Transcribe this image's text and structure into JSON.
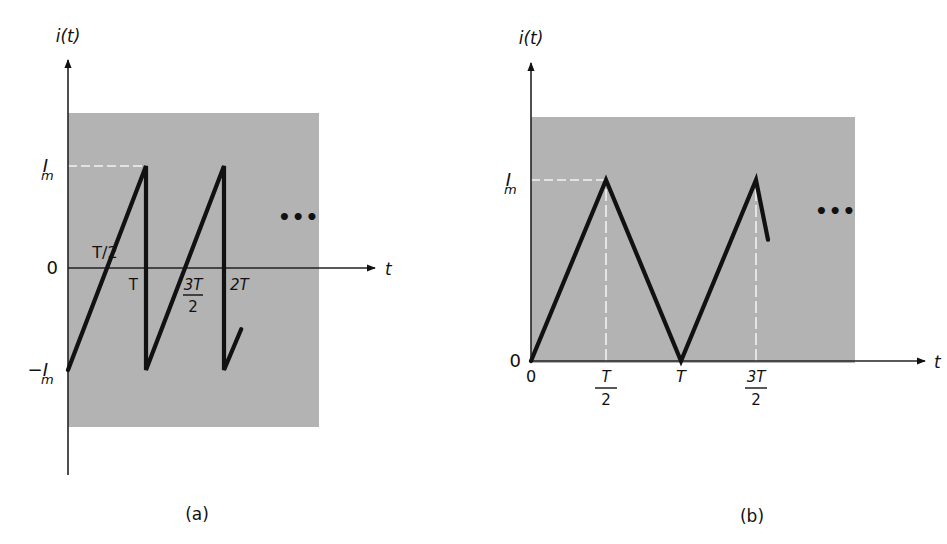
{
  "colors": {
    "background": "#ffffff",
    "panel_fill": "#b3b3b3",
    "waveform": "#111111",
    "axis": "#222222",
    "guide": "#f2f2f2"
  },
  "chart_data": [
    {
      "type": "line",
      "panel_label": "(a)",
      "title": "Sawtooth current waveform",
      "ylabel": "i(t)",
      "xlabel": "t",
      "y_ticks": [
        {
          "label": "I",
          "sub": "m",
          "value": 1
        },
        {
          "label": "0",
          "sub": "",
          "value": 0
        },
        {
          "label": "−I",
          "sub": "m",
          "value": -1
        }
      ],
      "x_ticks": [
        {
          "label": "T/2",
          "value": 0.5,
          "fraction": false
        },
        {
          "label": "T",
          "value": 1.0,
          "fraction": false
        },
        {
          "num": "3T",
          "den": "2",
          "value": 1.5,
          "fraction": true
        },
        {
          "label": "2T",
          "value": 2.0,
          "fraction": false
        }
      ],
      "xlim": [
        0,
        3.0
      ],
      "ylim": [
        -1.6,
        1.5
      ],
      "points": [
        [
          0,
          -1
        ],
        [
          1,
          1
        ],
        [
          1,
          -1
        ],
        [
          2,
          1
        ],
        [
          2,
          -1
        ],
        [
          2.22,
          -0.6
        ]
      ],
      "guides": [
        {
          "kind": "horizontal",
          "from": [
            0,
            1
          ],
          "to": [
            1,
            1
          ]
        }
      ],
      "continuation": "•••"
    },
    {
      "type": "line",
      "panel_label": "(b)",
      "title": "Triangular current waveform",
      "ylabel": "i(t)",
      "xlabel": "t",
      "y_ticks": [
        {
          "label": "I",
          "sub": "m",
          "value": 1
        },
        {
          "label": "0",
          "sub": "",
          "value": 0
        }
      ],
      "x_ticks": [
        {
          "label": "0",
          "value": 0,
          "fraction": false
        },
        {
          "num": "T",
          "den": "2",
          "value": 0.5,
          "fraction": true
        },
        {
          "label": "T",
          "value": 1.0,
          "fraction": false
        },
        {
          "num": "3T",
          "den": "2",
          "value": 1.5,
          "fraction": true
        }
      ],
      "xlim": [
        0,
        2.15
      ],
      "ylim": [
        0,
        1.35
      ],
      "points": [
        [
          0,
          0
        ],
        [
          0.5,
          1
        ],
        [
          1,
          0
        ],
        [
          1.5,
          1
        ],
        [
          1.58,
          0.67
        ]
      ],
      "guides": [
        {
          "kind": "horizontal",
          "from": [
            0,
            1
          ],
          "to": [
            0.5,
            1
          ]
        },
        {
          "kind": "vertical",
          "from": [
            0.5,
            0
          ],
          "to": [
            0.5,
            1
          ]
        },
        {
          "kind": "vertical",
          "from": [
            1.5,
            0
          ],
          "to": [
            1.5,
            1
          ]
        }
      ],
      "continuation": "•••"
    }
  ]
}
